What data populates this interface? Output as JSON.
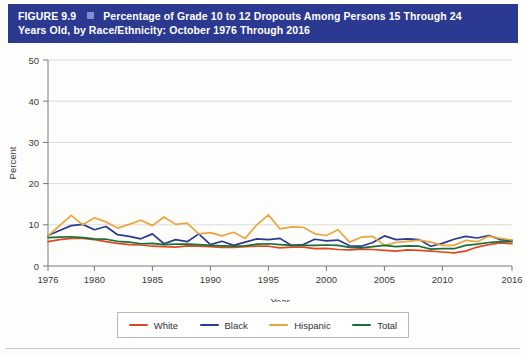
{
  "figure": {
    "number": "FIGURE 9.9",
    "title_line1": "Percentage of Grade 10 to 12 Dropouts Among Persons 15 Through 24",
    "title_line2": "Years Old, by Race/Ethnicity: October 1976 Through 2016",
    "banner_color": "#2b3990",
    "bullet_color": "#7b8fd4"
  },
  "chart_data": {
    "type": "line",
    "title": "Percentage of Grade 10 to 12 Dropouts Among Persons 15 Through 24 Years Old, by Race/Ethnicity: October 1976 Through 2016",
    "xlabel": "Year",
    "ylabel": "Percent",
    "xlim": [
      1976,
      2016
    ],
    "ylim": [
      0,
      50
    ],
    "yticks": [
      0,
      10,
      20,
      30,
      40,
      50
    ],
    "xticks": [
      1976,
      1980,
      1985,
      1990,
      1995,
      2000,
      2005,
      2010,
      2016
    ],
    "grid": "horizontal",
    "legend_position": "bottom-center",
    "x": [
      1976,
      1977,
      1978,
      1979,
      1980,
      1981,
      1982,
      1983,
      1984,
      1985,
      1986,
      1987,
      1988,
      1989,
      1990,
      1991,
      1992,
      1993,
      1994,
      1995,
      1996,
      1997,
      1998,
      1999,
      2000,
      2001,
      2002,
      2003,
      2004,
      2005,
      2006,
      2007,
      2008,
      2009,
      2010,
      2011,
      2012,
      2013,
      2014,
      2015,
      2016
    ],
    "series": [
      {
        "name": "White",
        "color": "#e0491f",
        "values": [
          5.9,
          6.4,
          6.7,
          6.7,
          6.4,
          5.9,
          5.5,
          5.2,
          5.1,
          4.8,
          4.7,
          4.6,
          4.9,
          4.8,
          4.7,
          4.5,
          4.5,
          4.7,
          4.8,
          4.8,
          4.4,
          4.6,
          4.6,
          4.2,
          4.3,
          4.0,
          3.9,
          4.1,
          4.0,
          3.8,
          3.6,
          3.9,
          3.8,
          3.6,
          3.4,
          3.2,
          3.6,
          4.6,
          5.2,
          5.6,
          5.4
        ]
      },
      {
        "name": "Black",
        "color": "#2b3990",
        "values": [
          7.4,
          8.6,
          9.8,
          10.1,
          8.8,
          9.6,
          7.6,
          7.2,
          6.6,
          7.8,
          5.4,
          6.4,
          5.9,
          7.8,
          5.2,
          6.0,
          5.0,
          5.8,
          6.6,
          6.4,
          6.7,
          5.0,
          5.2,
          6.5,
          6.1,
          6.3,
          4.9,
          4.8,
          5.7,
          7.3,
          6.4,
          6.6,
          6.4,
          4.8,
          5.5,
          6.5,
          7.2,
          6.8,
          7.4,
          6.4,
          6.2
        ]
      },
      {
        "name": "Hispanic",
        "color": "#eaa53c",
        "values": [
          7.3,
          9.8,
          12.3,
          10.0,
          11.7,
          10.7,
          9.2,
          10.1,
          11.1,
          9.8,
          11.9,
          10.1,
          10.4,
          7.8,
          8.1,
          7.3,
          8.2,
          6.7,
          10.0,
          12.4,
          9.0,
          9.5,
          9.4,
          7.8,
          7.4,
          8.8,
          5.8,
          7.0,
          7.2,
          5.0,
          5.7,
          6.0,
          6.3,
          5.8,
          5.0,
          5.0,
          6.2,
          5.9,
          7.2,
          6.7,
          6.3
        ]
      },
      {
        "name": "Total",
        "color": "#15703a",
        "values": [
          6.9,
          7.0,
          7.1,
          6.9,
          6.6,
          6.5,
          6.0,
          5.8,
          5.4,
          5.5,
          5.2,
          5.3,
          5.3,
          5.2,
          5.0,
          4.9,
          4.8,
          4.9,
          5.3,
          5.4,
          5.2,
          5.0,
          5.0,
          5.0,
          5.1,
          5.0,
          4.5,
          4.4,
          4.7,
          5.0,
          4.7,
          4.9,
          4.8,
          4.1,
          4.2,
          4.2,
          5.0,
          5.3,
          5.7,
          5.9,
          5.9
        ]
      }
    ]
  },
  "legend": {
    "items": [
      {
        "label": "White",
        "color": "#e0491f"
      },
      {
        "label": "Black",
        "color": "#2b3990"
      },
      {
        "label": "Hispanic",
        "color": "#eaa53c"
      },
      {
        "label": "Total",
        "color": "#15703a"
      }
    ]
  }
}
